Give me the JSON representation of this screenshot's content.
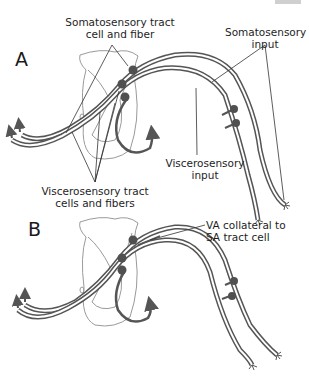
{
  "panels": [
    {
      "letter": "A",
      "labels": {
        "somatosensory_tract_1": "Somatosensory tract",
        "somatosensory_tract_2": "cell and fiber",
        "somatosensory_input_1": "Somatosensory",
        "somatosensory_input_2": "input",
        "viscerosensory_input_1": "Viscerosensory",
        "viscerosensory_input_2": "input",
        "viscerosensory_tract_1": "Viscerosensory tract",
        "viscerosensory_tract_2": "cells and fibers"
      }
    },
    {
      "letter": "B",
      "labels": {
        "va_collateral_1": "VA collateral to",
        "va_collateral_2": "SA tract cell"
      }
    }
  ],
  "colors": {
    "fiber": "#555555",
    "fiber_fill": "#ffffff",
    "cord_outline": "#9a9a9a",
    "cell_body": "#505050",
    "leader_line": "#333333"
  }
}
